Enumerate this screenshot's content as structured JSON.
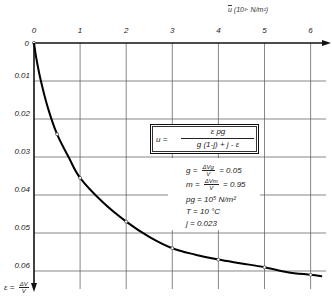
{
  "chart_data": {
    "type": "line",
    "title": "",
    "xlabel": "u (10^3 N/m²)",
    "ylabel": "ε = ΔV/V",
    "x_ticks": [
      "0",
      "1",
      "2",
      "3",
      "4",
      "5",
      "6"
    ],
    "y_ticks": [
      "0",
      "0.01",
      "0.02",
      "0.03",
      "0.04",
      "0.05",
      "0.06"
    ],
    "xlim": [
      0,
      6.3
    ],
    "ylim": [
      0,
      0.065
    ],
    "y_axis_inverted": true,
    "grid": true,
    "series": [
      {
        "name": "ε vs u",
        "x": [
          0,
          0.5,
          1.0,
          2.0,
          3.0,
          4.0,
          5.0,
          6.0
        ],
        "values": [
          0,
          0.024,
          0.0355,
          0.047,
          0.054,
          0.057,
          0.059,
          0.061
        ]
      }
    ],
    "curve_x": [
      0,
      0.05,
      0.15,
      0.3,
      0.5,
      0.75,
      1.0,
      1.5,
      2.0,
      2.5,
      3.0,
      3.5,
      4.0,
      4.5,
      5.0,
      5.5,
      6.0,
      6.25
    ],
    "curve_y": [
      0,
      0.004,
      0.01,
      0.017,
      0.024,
      0.03,
      0.0355,
      0.042,
      0.047,
      0.051,
      0.054,
      0.0557,
      0.057,
      0.058,
      0.059,
      0.0603,
      0.061,
      0.0614
    ],
    "annotations": {
      "formula": "u = ε p_g / (g (1-j) + j - ε)",
      "parameters": [
        "g = ΔVg/V = 0.05",
        "m = ΔVm/V = 0.95",
        "p_g = 10^5 N/m²",
        "T = 10 °C",
        "j = 0.023"
      ]
    }
  },
  "labels": {
    "x_axis_u": "u",
    "x_axis_unit": "(10³· N/m²)",
    "y_axis_eps": "ε =",
    "y_axis_num": "ΔV",
    "y_axis_den": "V",
    "formula": {
      "lhs": "u =",
      "numerator": "ε pg",
      "denominator": "g (1-j) + j - ε"
    },
    "params": {
      "g_sym": "g =",
      "g_num": "ΔVg",
      "g_den": "V",
      "g_val": "= 0.05",
      "m_sym": "m =",
      "m_num": "ΔVm",
      "m_den": "V",
      "m_val": "= 0.95",
      "pg": "pg =  10⁵ N/m²",
      "T": "T  =   10 °C",
      "j": "j  =  0.023"
    }
  }
}
